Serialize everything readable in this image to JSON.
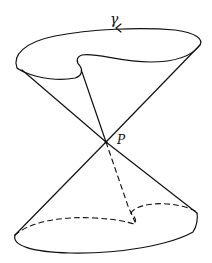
{
  "figure": {
    "labels": {
      "curve": "γ",
      "apex": "P"
    },
    "colors": {
      "stroke": "#111111",
      "background": "#ffffff"
    }
  }
}
